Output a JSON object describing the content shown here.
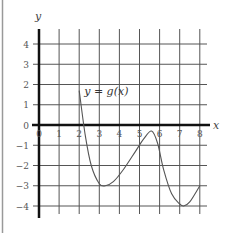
{
  "chart_data": {
    "type": "line",
    "title": "",
    "xlabel": "x",
    "ylabel": "y",
    "xlim": [
      0,
      8
    ],
    "ylim": [
      -4,
      4
    ],
    "grid": true,
    "x_ticks": [
      "0",
      "1",
      "2",
      "3",
      "4",
      "5",
      "6",
      "7",
      "8"
    ],
    "y_ticks": [
      "4",
      "3",
      "2",
      "1",
      "0",
      "-1",
      "-2",
      "-3",
      "-4"
    ],
    "annotation": "y = g(x)",
    "series": [
      {
        "name": "y = g(x)",
        "x": [
          2.0,
          2.3,
          2.6,
          3.0,
          3.3,
          3.7,
          4.2,
          4.8,
          5.2,
          5.6,
          5.9,
          6.2,
          6.6,
          7.0,
          7.2,
          7.5,
          8.0
        ],
        "values": [
          1.7,
          -0.5,
          -2.0,
          -2.9,
          -3.0,
          -2.8,
          -2.2,
          -1.3,
          -0.7,
          -0.3,
          -0.9,
          -2.2,
          -3.4,
          -3.9,
          -4.0,
          -3.8,
          -3.0
        ]
      }
    ],
    "key_points": [
      {
        "label": "start",
        "x": 2,
        "y": 1.7
      },
      {
        "label": "local min",
        "x": 3.3,
        "y": -3
      },
      {
        "label": "local max",
        "x": 5.6,
        "y": -0.3
      },
      {
        "label": "local min",
        "x": 7.2,
        "y": -4
      },
      {
        "label": "end",
        "x": 8,
        "y": -3
      }
    ]
  },
  "labels": {
    "x_axis": "x",
    "y_axis": "y",
    "curve": "y = g(x)"
  },
  "colors": {
    "grid": "#555555",
    "axis": "#111111",
    "curve": "#555555",
    "border": "#999999"
  }
}
